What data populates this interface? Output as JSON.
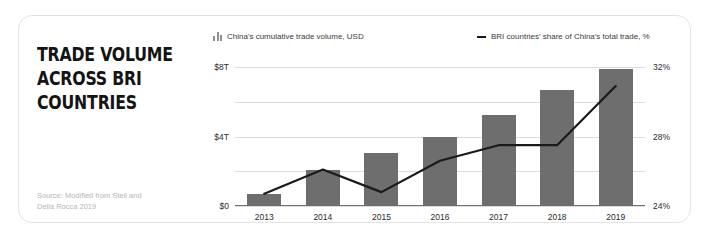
{
  "card": {
    "title": "TRADE VOLUME\nACROSS BRI\nCOUNTRIES",
    "source": "Source: Modified from Steil and\nDella Rocca 2019"
  },
  "legend": {
    "bars_label": "China's cumulative trade volume, USD",
    "bars_icon": "bar-chart-icon",
    "line_label": "BRI countries' share of China's total trade, %",
    "line_icon": "line-dash-icon"
  },
  "colors": {
    "bar": "#6e6e6e",
    "line": "#1a1a1a",
    "grid": "#dcdcdc",
    "title": "#141414",
    "source": "#b6b6b6",
    "card_border": "#e3e3e3"
  },
  "chart_data": {
    "type": "bar",
    "title": "TRADE VOLUME ACROSS BRI COUNTRIES",
    "subtitle": "",
    "xlabel": "",
    "ylabel": "China's cumulative trade volume, USD",
    "y2label": "BRI countries' share of China's total trade, %",
    "categories": [
      "2013",
      "2014",
      "2015",
      "2016",
      "2017",
      "2018",
      "2019"
    ],
    "ylim": [
      0,
      8
    ],
    "y_ticks": [
      0,
      2,
      4,
      6,
      8
    ],
    "y_tick_labels": [
      "$0",
      "",
      "$4T",
      "",
      "$8T"
    ],
    "y2lim": [
      24,
      32
    ],
    "y2_ticks": [
      24,
      28,
      32
    ],
    "y2_tick_labels": [
      "24%",
      "28%",
      "32%"
    ],
    "grid": true,
    "legend_position": "top",
    "series": [
      {
        "name": "China's cumulative trade volume, USD",
        "type": "bar",
        "axis": "left",
        "unit": "trillion USD",
        "values": [
          0.65,
          2.0,
          3.0,
          3.9,
          5.2,
          6.6,
          7.8
        ]
      },
      {
        "name": "BRI countries' share of China's total trade, %",
        "type": "line",
        "axis": "right",
        "unit": "%",
        "values": [
          24.7,
          26.1,
          24.8,
          26.6,
          27.5,
          27.5,
          30.9
        ]
      }
    ]
  }
}
